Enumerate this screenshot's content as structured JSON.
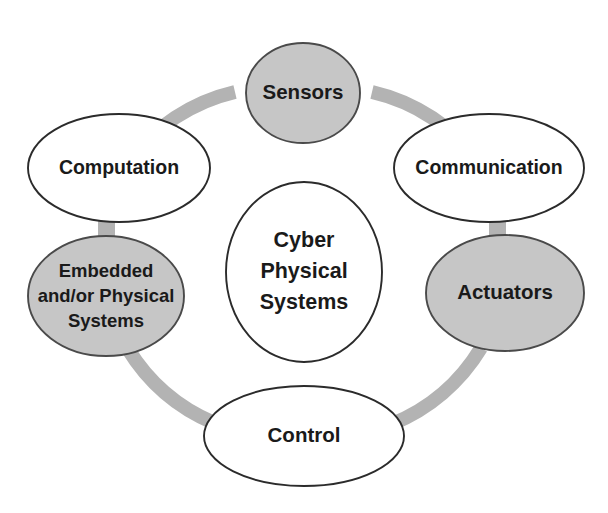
{
  "diagram": {
    "title": "Cyber Physical Systems",
    "type": "cycle-diagram",
    "colors": {
      "gray_fill": "#c6c6c6",
      "white_fill": "#ffffff",
      "ring": "#b3b3b3",
      "outline": "#2b2b2b",
      "text": "#1a1a1a"
    },
    "center": {
      "name": "center-node",
      "shape": "ellipse",
      "fill": "white",
      "lines": [
        "Cyber",
        "Physical",
        "Systems"
      ]
    },
    "nodes": [
      {
        "id": "sensors",
        "shape": "ellipse",
        "fill": "gray",
        "position": "top",
        "lines": [
          "Sensors"
        ]
      },
      {
        "id": "communication",
        "shape": "ellipse",
        "fill": "white",
        "position": "top-right",
        "lines": [
          "Communication"
        ]
      },
      {
        "id": "actuators",
        "shape": "ellipse",
        "fill": "gray",
        "position": "right",
        "lines": [
          "Actuators"
        ]
      },
      {
        "id": "control",
        "shape": "ellipse",
        "fill": "white",
        "position": "bottom",
        "lines": [
          "Control"
        ]
      },
      {
        "id": "embedded",
        "shape": "ellipse",
        "fill": "gray",
        "position": "left",
        "lines": [
          "Embedded",
          "and/or Physical",
          "Systems"
        ]
      },
      {
        "id": "computation",
        "shape": "ellipse",
        "fill": "white",
        "position": "top-left",
        "lines": [
          "Computation"
        ]
      }
    ]
  }
}
